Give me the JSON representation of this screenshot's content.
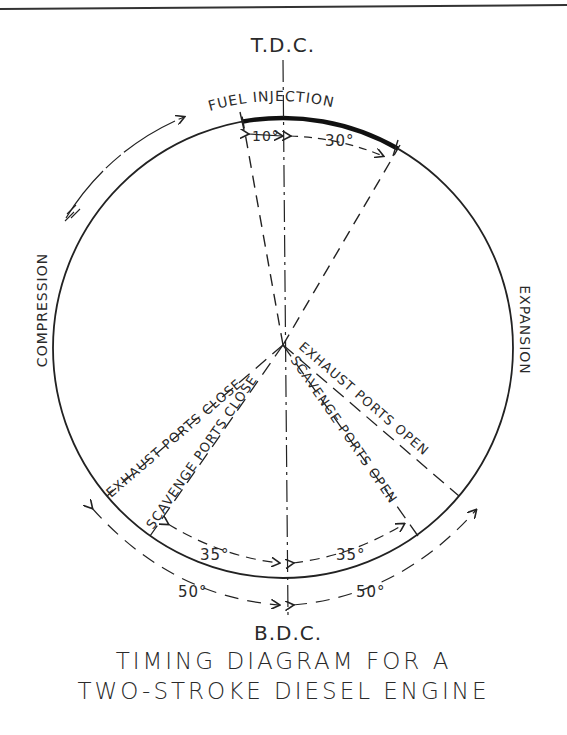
{
  "diagram": {
    "top_label": "T.D.C.",
    "bottom_label": "B.D.C.",
    "fuel_injection_label": "FUEL INJECTION",
    "fuel_before_tdc": "10°",
    "fuel_after_tdc": "30°",
    "compression_label": "COMPRESSION",
    "expansion_label": "EXPANSION",
    "exhaust_close_label": "EXHAUST PORTS CLOSE",
    "scavenge_close_label": "SCAVENGE PORTS CLOSE",
    "exhaust_open_label": "EXHAUST PORTS OPEN",
    "scavenge_open_label": "SCAVENGE PORTS OPEN",
    "scavenge_left_angle": "35°",
    "scavenge_right_angle": "35°",
    "exhaust_left_angle": "50°",
    "exhaust_right_angle": "50°"
  },
  "caption": {
    "line1": "TIMING DIAGRAM FOR A",
    "line2": "TWO-STROKE DIESEL ENGINE"
  }
}
